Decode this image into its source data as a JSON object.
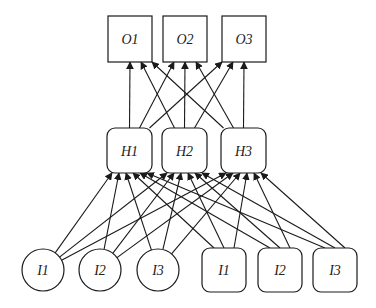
{
  "diagram": {
    "type": "neural-network",
    "layers": {
      "output": [
        {
          "id": "o1",
          "label": "O1",
          "shape": "square",
          "x": 108,
          "y": 16,
          "w": 44,
          "h": 46
        },
        {
          "id": "o2",
          "label": "O2",
          "shape": "square",
          "x": 163,
          "y": 16,
          "w": 44,
          "h": 46
        },
        {
          "id": "o3",
          "label": "O3",
          "shape": "square",
          "x": 222,
          "y": 16,
          "w": 44,
          "h": 46
        }
      ],
      "hidden": [
        {
          "id": "h1",
          "label": "H1",
          "shape": "rounded",
          "x": 107,
          "y": 128,
          "w": 45,
          "h": 45
        },
        {
          "id": "h2",
          "label": "H2",
          "shape": "rounded",
          "x": 162,
          "y": 128,
          "w": 45,
          "h": 45
        },
        {
          "id": "h3",
          "label": "H3",
          "shape": "rounded",
          "x": 221,
          "y": 128,
          "w": 45,
          "h": 45
        }
      ],
      "input_circles": [
        {
          "id": "ic1",
          "label": "I1",
          "shape": "circle",
          "cx": 43,
          "cy": 270,
          "r": 21
        },
        {
          "id": "ic2",
          "label": "I2",
          "shape": "circle",
          "cx": 100,
          "cy": 270,
          "r": 21
        },
        {
          "id": "ic3",
          "label": "I3",
          "shape": "circle",
          "cx": 158,
          "cy": 270,
          "r": 21
        }
      ],
      "input_squares": [
        {
          "id": "is1",
          "label": "I1",
          "shape": "rounded",
          "x": 202,
          "y": 248,
          "w": 44,
          "h": 44
        },
        {
          "id": "is2",
          "label": "I2",
          "shape": "rounded",
          "x": 258,
          "y": 248,
          "w": 44,
          "h": 44
        },
        {
          "id": "is3",
          "label": "I3",
          "shape": "rounded",
          "x": 313,
          "y": 248,
          "w": 44,
          "h": 44
        }
      ]
    },
    "edges": {
      "inputs_to_hidden": "all-to-all",
      "hidden_to_output": "all-to-all"
    },
    "colors": {
      "stroke": "#1a1a1a",
      "fill": "#ffffff",
      "text": "#222222"
    }
  }
}
